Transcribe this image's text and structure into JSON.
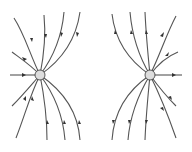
{
  "diagram": {
    "title": "Electric field lines of two point charges",
    "type": "field-lines",
    "charges": [
      {
        "id": "left",
        "x": 40,
        "y": 75,
        "label": ""
      },
      {
        "id": "right",
        "x": 150,
        "y": 75,
        "label": ""
      }
    ],
    "colors": {
      "line": "#555555",
      "arrow": "#333333",
      "background": "#ffffff"
    }
  }
}
